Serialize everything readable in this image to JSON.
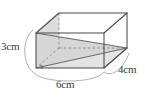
{
  "figure": {
    "name": "cuboid-with-inscribed-triangle",
    "shape": "rectangular prism (cuboid)",
    "projection": "oblique / parallel projection",
    "background_color": "#ffffff",
    "edge_color": "#4a4a4a",
    "hidden_edge_color": "#7a7a7a",
    "shaded_face_color": "#dcdcdc",
    "shaded_face_color_2": "#d2d2d2",
    "brace_color": "#9a9a9a",
    "text_color": "#3a3a3a"
  },
  "labels": {
    "height": "3cm",
    "length": "6cm",
    "depth": "4cm"
  },
  "dimensions": {
    "height_value": 3,
    "length_value": 6,
    "depth_value": 4,
    "unit": "cm"
  },
  "geometry": {
    "front_bottom_left": [
      36,
      68
    ],
    "front_bottom_right": [
      104,
      68
    ],
    "front_top_left": [
      36,
      33
    ],
    "front_top_right": [
      104,
      33
    ],
    "back_bottom_left": [
      59,
      48
    ],
    "back_bottom_right": [
      127,
      48
    ],
    "back_top_left": [
      59,
      13
    ],
    "back_top_right": [
      127,
      13
    ]
  },
  "annotations": {
    "right_angle_marker": "right-angle-tick at front bottom left",
    "dashed_edges": "hidden back-left vertical edge and hidden base diagonals",
    "shaded_region": "inscribed triangle / pyramid with apex at back bottom right"
  }
}
